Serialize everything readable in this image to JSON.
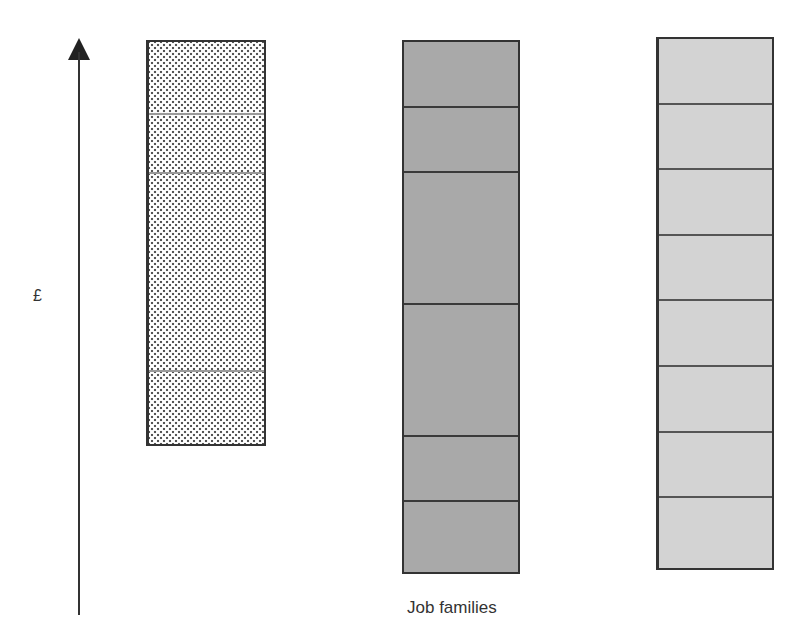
{
  "axis": {
    "y_label": "£",
    "x_label": "Job families",
    "arrow": "up-arrow-icon"
  },
  "bars": [
    {
      "name": "job-family-1",
      "style": "crosshatch",
      "x": 146,
      "top": 40,
      "bottom": 446,
      "width": 120,
      "dividers": [
        113,
        172,
        370
      ],
      "bands": 4
    },
    {
      "name": "job-family-2",
      "style": "dark-grey",
      "x": 402,
      "top": 40,
      "bottom": 574,
      "width": 118,
      "dividers": [
        106,
        171,
        303,
        435,
        500
      ],
      "bands": 6
    },
    {
      "name": "job-family-3",
      "style": "light-grey",
      "x": 656,
      "top": 37,
      "bottom": 570,
      "width": 118,
      "dividers": [
        103,
        168,
        234,
        299,
        365,
        431,
        496
      ],
      "bands": 8
    }
  ],
  "colors": {
    "axis": "#333333",
    "dark_bar": "#a9a9a9",
    "light_bar": "#d3d3d3"
  }
}
